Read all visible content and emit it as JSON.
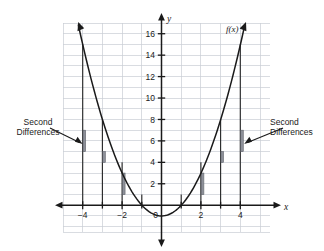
{
  "figure": {
    "title": "",
    "function_label": "f(x)",
    "axis_labels": {
      "x": "x",
      "y": "y"
    },
    "origin_label": "0",
    "annotations": [
      {
        "name": "second-differences-left",
        "line1": "Second",
        "line2": "Differences",
        "side": "left"
      },
      {
        "name": "second-differences-right",
        "line1": "Second",
        "line2": "Differences",
        "side": "right"
      }
    ],
    "colors": {
      "grid": "#c9cdd4",
      "axis": "#1a1a1a",
      "curve": "#1a1a1a",
      "drop_line": "#1a1a1a",
      "difference_bar": "#8d9099",
      "text": "#1a1a1a",
      "background": "#ffffff"
    }
  },
  "chart_data": {
    "type": "line",
    "title": "",
    "xlabel": "x",
    "ylabel": "y",
    "function_label": "f(x)",
    "equation": "f(x) = x^2",
    "grid": true,
    "legend": "none",
    "xlim": [
      -5,
      5.5
    ],
    "ylim": [
      -1.5,
      18
    ],
    "xticks": [
      -4,
      -2,
      0,
      2,
      4
    ],
    "xticklabels": [
      "-4",
      "-2",
      "0",
      "2",
      "4"
    ],
    "yticks": [
      2,
      4,
      6,
      8,
      10,
      12,
      14,
      16
    ],
    "yticklabels": [
      "2",
      "4",
      "6",
      "8",
      "10",
      "12",
      "14",
      "16"
    ],
    "minor_tick_step": 1,
    "x": [
      -4,
      -3,
      -2,
      -1,
      0,
      1,
      2,
      3,
      4
    ],
    "values": [
      16,
      9,
      4,
      1,
      0,
      1,
      4,
      9,
      16
    ],
    "drop_lines": [
      {
        "x": -4,
        "y": 16
      },
      {
        "x": -3,
        "y": 9
      },
      {
        "x": -2,
        "y": 4
      },
      {
        "x": -1,
        "y": 1
      },
      {
        "x": 0,
        "y": 0
      },
      {
        "x": 1,
        "y": 1
      },
      {
        "x": 2,
        "y": 4
      },
      {
        "x": 3,
        "y": 9
      },
      {
        "x": 4,
        "y": 16
      }
    ],
    "second_difference_bars": [
      {
        "name": "bar-x-minus-4",
        "x": -4,
        "y_bottom": 5,
        "y_top": 7,
        "value": 2
      },
      {
        "name": "bar-x-minus-3",
        "x": -3,
        "y_bottom": 4,
        "y_top": 5,
        "value": 2
      },
      {
        "name": "bar-x-minus-2",
        "x": -2,
        "y_bottom": 1,
        "y_top": 3,
        "value": 2
      },
      {
        "name": "bar-x-plus-2",
        "x": 2,
        "y_bottom": 1,
        "y_top": 3,
        "value": 2
      },
      {
        "name": "bar-x-plus-3",
        "x": 3,
        "y_bottom": 4,
        "y_top": 5,
        "value": 2
      },
      {
        "name": "bar-x-plus-4",
        "x": 4,
        "y_bottom": 5,
        "y_top": 7,
        "value": 2
      }
    ],
    "annotation_arrows": [
      {
        "name": "arrow-left",
        "from_x": -5.6,
        "from_y": 7.4,
        "to_x": -4.15,
        "to_y": 6.6
      },
      {
        "name": "arrow-right",
        "from_x": 5.6,
        "from_y": 7.4,
        "to_x": 4.2,
        "to_y": 6.6
      }
    ]
  }
}
